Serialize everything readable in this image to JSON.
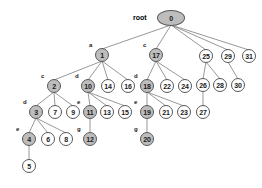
{
  "diagram": {
    "root_label": "root",
    "colors": {
      "node_fill_highlight": "#bdbdbd",
      "node_fill_plain": "#ffffff",
      "node_stroke": "#58585a",
      "edge_stroke": "#8c8c8c",
      "text": "#1a1a1a",
      "background": "#ffffff"
    },
    "nodes": [
      {
        "id": "n0",
        "value": "0",
        "tag": "",
        "x": 171,
        "y": 18,
        "rx": 14,
        "ry": 8,
        "fill": "gray"
      },
      {
        "id": "n1",
        "value": "1",
        "tag": "a",
        "x": 102,
        "y": 55,
        "rx": 7,
        "ry": 7,
        "fill": "gray"
      },
      {
        "id": "n17",
        "value": "17",
        "tag": "c",
        "x": 156,
        "y": 55,
        "rx": 7,
        "ry": 7,
        "fill": "gray"
      },
      {
        "id": "n25",
        "value": "25",
        "tag": "",
        "x": 206,
        "y": 56,
        "rx": 7,
        "ry": 7,
        "fill": "white"
      },
      {
        "id": "n29",
        "value": "29",
        "tag": "",
        "x": 228,
        "y": 56,
        "rx": 7,
        "ry": 7,
        "fill": "white"
      },
      {
        "id": "n31",
        "value": "31",
        "tag": "",
        "x": 249,
        "y": 56,
        "rx": 7,
        "ry": 7,
        "fill": "white"
      },
      {
        "id": "n2",
        "value": "2",
        "tag": "c",
        "x": 54,
        "y": 86,
        "rx": 7,
        "ry": 7,
        "fill": "gray"
      },
      {
        "id": "n10",
        "value": "10",
        "tag": "d",
        "x": 88,
        "y": 86,
        "rx": 7,
        "ry": 7,
        "fill": "gray"
      },
      {
        "id": "n14",
        "value": "14",
        "tag": "",
        "x": 108,
        "y": 86,
        "rx": 7,
        "ry": 7,
        "fill": "white"
      },
      {
        "id": "n16",
        "value": "16",
        "tag": "",
        "x": 128,
        "y": 86,
        "rx": 7,
        "ry": 7,
        "fill": "white"
      },
      {
        "id": "n18",
        "value": "18",
        "tag": "d",
        "x": 147,
        "y": 86,
        "rx": 7,
        "ry": 7,
        "fill": "gray"
      },
      {
        "id": "n22",
        "value": "22",
        "tag": "",
        "x": 167,
        "y": 86,
        "rx": 7,
        "ry": 7,
        "fill": "white"
      },
      {
        "id": "n24",
        "value": "24",
        "tag": "",
        "x": 185,
        "y": 86,
        "rx": 7,
        "ry": 7,
        "fill": "white"
      },
      {
        "id": "n26",
        "value": "26",
        "tag": "",
        "x": 203,
        "y": 85,
        "rx": 7,
        "ry": 7,
        "fill": "white"
      },
      {
        "id": "n28",
        "value": "28",
        "tag": "",
        "x": 220,
        "y": 85,
        "rx": 7,
        "ry": 7,
        "fill": "white"
      },
      {
        "id": "n30",
        "value": "30",
        "tag": "",
        "x": 238,
        "y": 85,
        "rx": 7,
        "ry": 7,
        "fill": "white"
      },
      {
        "id": "n3",
        "value": "3",
        "tag": "d",
        "x": 36,
        "y": 112,
        "rx": 7,
        "ry": 7,
        "fill": "gray"
      },
      {
        "id": "n7",
        "value": "7",
        "tag": "",
        "x": 55,
        "y": 112,
        "rx": 7,
        "ry": 7,
        "fill": "white"
      },
      {
        "id": "n9",
        "value": "9",
        "tag": "",
        "x": 73,
        "y": 112,
        "rx": 7,
        "ry": 7,
        "fill": "white"
      },
      {
        "id": "n11",
        "value": "11",
        "tag": "e",
        "x": 90,
        "y": 112,
        "rx": 7,
        "ry": 7,
        "fill": "gray"
      },
      {
        "id": "n13",
        "value": "13",
        "tag": "",
        "x": 107,
        "y": 112,
        "rx": 7,
        "ry": 7,
        "fill": "white"
      },
      {
        "id": "n15",
        "value": "15",
        "tag": "",
        "x": 125,
        "y": 112,
        "rx": 7,
        "ry": 7,
        "fill": "white"
      },
      {
        "id": "n19",
        "value": "19",
        "tag": "e",
        "x": 147,
        "y": 112,
        "rx": 7,
        "ry": 7,
        "fill": "gray"
      },
      {
        "id": "n21",
        "value": "21",
        "tag": "",
        "x": 166,
        "y": 112,
        "rx": 7,
        "ry": 7,
        "fill": "white"
      },
      {
        "id": "n23",
        "value": "23",
        "tag": "",
        "x": 184,
        "y": 112,
        "rx": 7,
        "ry": 7,
        "fill": "white"
      },
      {
        "id": "n27",
        "value": "27",
        "tag": "",
        "x": 203,
        "y": 112,
        "rx": 7,
        "ry": 7,
        "fill": "white"
      },
      {
        "id": "n4",
        "value": "4",
        "tag": "e",
        "x": 29,
        "y": 139,
        "rx": 7,
        "ry": 7,
        "fill": "gray"
      },
      {
        "id": "n6",
        "value": "6",
        "tag": "",
        "x": 48,
        "y": 139,
        "rx": 7,
        "ry": 7,
        "fill": "white"
      },
      {
        "id": "n8",
        "value": "8",
        "tag": "",
        "x": 66,
        "y": 139,
        "rx": 7,
        "ry": 7,
        "fill": "white"
      },
      {
        "id": "n12",
        "value": "12",
        "tag": "g",
        "x": 90,
        "y": 139,
        "rx": 7,
        "ry": 7,
        "fill": "gray"
      },
      {
        "id": "n20",
        "value": "20",
        "tag": "g",
        "x": 147,
        "y": 139,
        "rx": 7,
        "ry": 7,
        "fill": "gray"
      },
      {
        "id": "n5",
        "value": "5",
        "tag": "",
        "x": 29,
        "y": 166,
        "rx": 7,
        "ry": 7,
        "fill": "white"
      }
    ],
    "edges": [
      [
        "n0",
        "n1"
      ],
      [
        "n0",
        "n17"
      ],
      [
        "n0",
        "n25"
      ],
      [
        "n0",
        "n29"
      ],
      [
        "n0",
        "n31"
      ],
      [
        "n1",
        "n2"
      ],
      [
        "n1",
        "n10"
      ],
      [
        "n1",
        "n14"
      ],
      [
        "n1",
        "n16"
      ],
      [
        "n17",
        "n18"
      ],
      [
        "n17",
        "n22"
      ],
      [
        "n17",
        "n24"
      ],
      [
        "n25",
        "n26"
      ],
      [
        "n25",
        "n28"
      ],
      [
        "n29",
        "n30"
      ],
      [
        "n2",
        "n3"
      ],
      [
        "n2",
        "n7"
      ],
      [
        "n2",
        "n9"
      ],
      [
        "n10",
        "n11"
      ],
      [
        "n10",
        "n13"
      ],
      [
        "n10",
        "n15"
      ],
      [
        "n18",
        "n19"
      ],
      [
        "n18",
        "n21"
      ],
      [
        "n18",
        "n23"
      ],
      [
        "n26",
        "n27"
      ],
      [
        "n3",
        "n4"
      ],
      [
        "n3",
        "n6"
      ],
      [
        "n3",
        "n8"
      ],
      [
        "n11",
        "n12"
      ],
      [
        "n19",
        "n20"
      ],
      [
        "n4",
        "n5"
      ]
    ]
  }
}
